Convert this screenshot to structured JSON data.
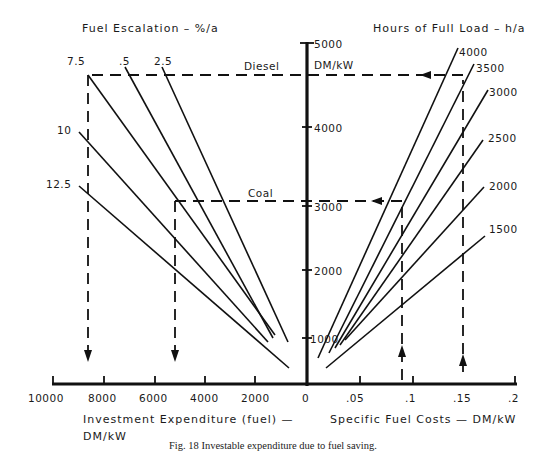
{
  "figure": {
    "caption": "Fig. 18 Investable expenditure due to fuel saving.",
    "left_title": "Fuel Escalation – %/a",
    "right_title": "Hours of Full Load – h/a",
    "left_xlabel_line1": "Investment  Expenditure (fuel) —",
    "left_xlabel_line2": "DM/kW",
    "right_xlabel": "Specific  Fuel  Costs — DM/kW",
    "yaxis_unit": "DM/kW",
    "yaxis_ticks": [
      "5000",
      "4000",
      "3000",
      "2000",
      "1000"
    ],
    "left_xticks": [
      "10000",
      "8000",
      "6000",
      "4000",
      "2000",
      "0"
    ],
    "right_xticks": [
      ".05",
      ".1",
      ".15",
      ".2"
    ],
    "escalation_labels": [
      "7.5",
      ".5",
      "2.5",
      "10",
      "12.5"
    ],
    "hours_labels": [
      "4000",
      "3500",
      "3000",
      "2500",
      "2000",
      "1500"
    ],
    "examples": [
      {
        "name": "Diesel",
        "specific_fuel_cost": 0.15,
        "escalation_pct": 7.5,
        "investment_DM_kW": 8700,
        "value_DM_kW": 4700
      },
      {
        "name": "Coal",
        "specific_fuel_cost": 0.095,
        "escalation_pct": 12.5,
        "investment_DM_kW": 5200,
        "value_DM_kW": 2700
      }
    ]
  }
}
